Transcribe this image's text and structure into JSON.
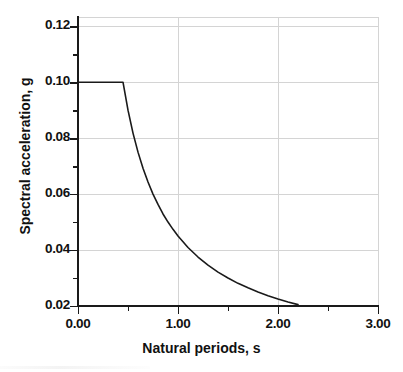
{
  "chart_data": {
    "type": "line",
    "title": "",
    "xlabel": "Natural periods, s",
    "ylabel": "Spectral acceleration, g",
    "xlim": [
      0.0,
      3.0
    ],
    "ylim": [
      0.02,
      0.1233
    ],
    "grid": true,
    "legend": null,
    "x_ticks": [
      {
        "value": 0.0,
        "label": "0.00",
        "type": "major"
      },
      {
        "value": 0.5,
        "label": "",
        "type": "minor"
      },
      {
        "value": 1.0,
        "label": "1.00",
        "type": "major"
      },
      {
        "value": 1.5,
        "label": "",
        "type": "minor"
      },
      {
        "value": 2.0,
        "label": "2.00",
        "type": "major"
      },
      {
        "value": 2.5,
        "label": "",
        "type": "minor"
      },
      {
        "value": 3.0,
        "label": "3.00",
        "type": "major"
      }
    ],
    "y_ticks": [
      {
        "value": 0.12,
        "label": "0.12",
        "type": "major"
      },
      {
        "value": 0.11,
        "label": "",
        "type": "minor"
      },
      {
        "value": 0.1,
        "label": "0.10",
        "type": "major"
      },
      {
        "value": 0.09,
        "label": "",
        "type": "minor"
      },
      {
        "value": 0.08,
        "label": "0.08",
        "type": "major"
      },
      {
        "value": 0.07,
        "label": "",
        "type": "minor"
      },
      {
        "value": 0.06,
        "label": "0.06",
        "type": "major"
      },
      {
        "value": 0.05,
        "label": "",
        "type": "minor"
      },
      {
        "value": 0.04,
        "label": "0.04",
        "type": "major"
      },
      {
        "value": 0.03,
        "label": "",
        "type": "minor"
      },
      {
        "value": 0.02,
        "label": "0.02",
        "type": "major"
      }
    ],
    "series": [
      {
        "name": "Design response spectrum",
        "color": "#1a1a1a",
        "plateau_value": 0.1,
        "corner_period": 0.45,
        "x": [
          0.0,
          0.1,
          0.2,
          0.3,
          0.4,
          0.45,
          0.5,
          0.55,
          0.6,
          0.65,
          0.7,
          0.75,
          0.8,
          0.85,
          0.9,
          0.95,
          1.0,
          1.1,
          1.2,
          1.3,
          1.4,
          1.5,
          1.6,
          1.7,
          1.8,
          1.9,
          2.0,
          2.1,
          2.2,
          2.3,
          2.4,
          2.5,
          2.6,
          2.7,
          2.8,
          2.9,
          3.0
        ],
        "values": [
          0.1,
          0.1,
          0.1,
          0.1,
          0.1,
          0.1,
          0.09,
          0.0818,
          0.075,
          0.0692,
          0.0643,
          0.06,
          0.0563,
          0.0529,
          0.05,
          0.0474,
          0.045,
          0.0409,
          0.0375,
          0.0346,
          0.0321,
          0.03,
          0.0281,
          0.0265,
          0.025,
          0.0237,
          0.0225,
          0.0214,
          0.0205,
          0.0196,
          0.0188,
          0.018,
          0.0173,
          0.0167,
          0.0161,
          0.0155,
          0.015
        ]
      }
    ]
  },
  "axes": {
    "x_title": "Natural periods, s",
    "y_title": "Spectral acceleration, g"
  }
}
